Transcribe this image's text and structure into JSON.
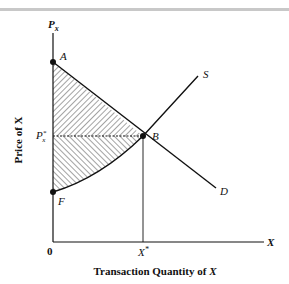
{
  "figure": {
    "y_axis_label": "Price of X",
    "y_axis_symbol": "P",
    "y_axis_symbol_sub": "x",
    "x_axis_label_prefix": "Transaction Quantity of ",
    "x_axis_label_var": "X",
    "x_axis_symbol": "X",
    "origin_label": "0",
    "equilibrium_quantity": "X",
    "equilibrium_quantity_sup": "*",
    "equilibrium_price": "P",
    "equilibrium_price_sup": "*",
    "equilibrium_price_sub": "x",
    "points": {
      "A": "A",
      "B": "B",
      "F": "F"
    },
    "curves": {
      "supply": "S",
      "demand": "D"
    },
    "shaded_region": "Area AFB (consumer + producer surplus, hatched)"
  },
  "colors": {
    "line": "#111111",
    "hatch": "#333333",
    "background": "#ffffff",
    "top_rule": "#c8c8c8"
  }
}
